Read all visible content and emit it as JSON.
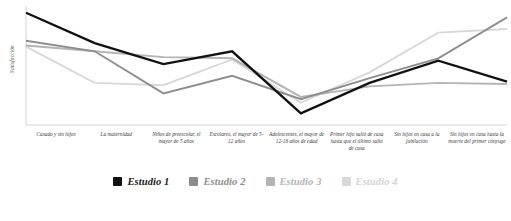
{
  "chart_data": {
    "type": "line",
    "title": "",
    "xlabel": "",
    "ylabel": "Satisfacción",
    "grid": false,
    "legend_position": "bottom",
    "ylim": [
      0,
      100
    ],
    "categories": [
      "Casado y sin hijos",
      "La maternidad",
      "Niños de preescolar, el mayor de 5 años",
      "Escolares, el mayor de 5-12 años",
      "Adolescentes, el mayor de 12-16 años de edad",
      "Primer hijo salió de casa hasta que el último salió de casa",
      "Sin hijos en casa a la jubilación",
      "Sin hijos en casa hasta la muerte del primer cónyuge"
    ],
    "series": [
      {
        "name": "Estudio 1",
        "color": "#111111",
        "values": [
          96,
          70,
          52,
          63,
          10,
          36,
          55,
          37
        ]
      },
      {
        "name": "Estudio 2",
        "color": "#8d8d8d",
        "values": [
          72,
          63,
          27,
          42,
          22,
          40,
          57,
          92
        ]
      },
      {
        "name": "Estudio 3",
        "color": "#b4b4b4",
        "values": [
          68,
          63,
          58,
          57,
          24,
          33,
          36,
          35
        ]
      },
      {
        "name": "Estudio 4",
        "color": "#d8d8d8",
        "values": [
          67,
          36,
          34,
          56,
          19,
          45,
          79,
          82
        ]
      }
    ]
  },
  "axis": {
    "y_title": "Satisfacción"
  },
  "legend": {
    "items": [
      {
        "label": "Estudio 1",
        "color": "#111111"
      },
      {
        "label": "Estudio 2",
        "color": "#8d8d8d"
      },
      {
        "label": "Estudio 3",
        "color": "#b4b4b4"
      },
      {
        "label": "Estudio 4",
        "color": "#d8d8d8"
      }
    ]
  }
}
